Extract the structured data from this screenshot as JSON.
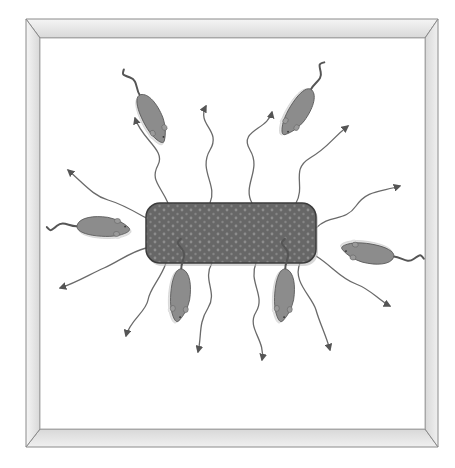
{
  "figure": {
    "width": 455,
    "height": 468,
    "colors": {
      "background": "#ffffff",
      "frame_light": "#f2f2f2",
      "frame_mid": "#dcdcdc",
      "frame_edge": "#8a8a8a",
      "food": "#6b6b6b",
      "food_dots": "#8a8a8a",
      "food_edge": "#3c3c3c",
      "mouse": "#8c8c8c",
      "mouse_edge": "#555555",
      "arrow": "#6a6a6a"
    },
    "frame": {
      "outer": [
        26,
        19,
        438,
        447
      ],
      "inner": [
        40,
        38,
        425,
        429
      ]
    },
    "food_block": {
      "x": 146,
      "y": 203,
      "w": 170,
      "h": 60,
      "r": 14
    },
    "mice": [
      {
        "id": "mouse-top-left",
        "cx": 152,
        "cy": 118,
        "angle": 64,
        "tail": "up-left"
      },
      {
        "id": "mouse-top-right",
        "cx": 298,
        "cy": 112,
        "angle": 122,
        "tail": "up-right"
      },
      {
        "id": "mouse-left",
        "cx": 103,
        "cy": 227,
        "angle": 4,
        "tail": "left"
      },
      {
        "id": "mouse-right",
        "cx": 368,
        "cy": 253,
        "angle": 190,
        "tail": "right"
      },
      {
        "id": "mouse-bottom-left",
        "cx": 180,
        "cy": 295,
        "angle": 95,
        "tail": "down"
      },
      {
        "id": "mouse-bottom-right",
        "cx": 284,
        "cy": 295,
        "angle": 95,
        "tail": "down"
      }
    ],
    "arrows": [
      {
        "id": "arrow-1",
        "path": "M 168 203 C 160 185, 150 180, 158 165 S 142 140, 135 118"
      },
      {
        "id": "arrow-2",
        "path": "M 210 203 C 218 185, 198 170, 210 150 S 196 125, 206 106"
      },
      {
        "id": "arrow-3",
        "path": "M 252 203 C 242 185, 262 170, 250 150 S 268 130, 272 112"
      },
      {
        "id": "arrow-4",
        "path": "M 296 203 C 306 185, 290 170, 310 158 S 330 140, 348 126"
      },
      {
        "id": "arrow-5",
        "path": "M 316 228 C 330 214, 345 222, 356 206 S 380 192, 400 186"
      },
      {
        "id": "arrow-6",
        "path": "M 146 218 C 132 210, 122 204, 108 200 S 86 186, 68 170"
      },
      {
        "id": "arrow-7",
        "path": "M 146 248 C 130 252, 118 262, 104 268 S 78 282, 60 288"
      },
      {
        "id": "arrow-8",
        "path": "M 166 263 C 160 280, 150 288, 148 300 S 130 320, 126 336"
      },
      {
        "id": "arrow-9",
        "path": "M 212 263 C 202 280, 218 292, 208 308 S 202 335, 198 352"
      },
      {
        "id": "arrow-10",
        "path": "M 256 263 C 248 282, 266 296, 256 312 S 266 340, 262 360"
      },
      {
        "id": "arrow-11",
        "path": "M 300 263 C 292 282, 312 296, 316 310 S 326 335, 330 350"
      },
      {
        "id": "arrow-12",
        "path": "M 316 256 C 332 266, 340 278, 356 284 S 378 300, 390 306"
      }
    ]
  }
}
